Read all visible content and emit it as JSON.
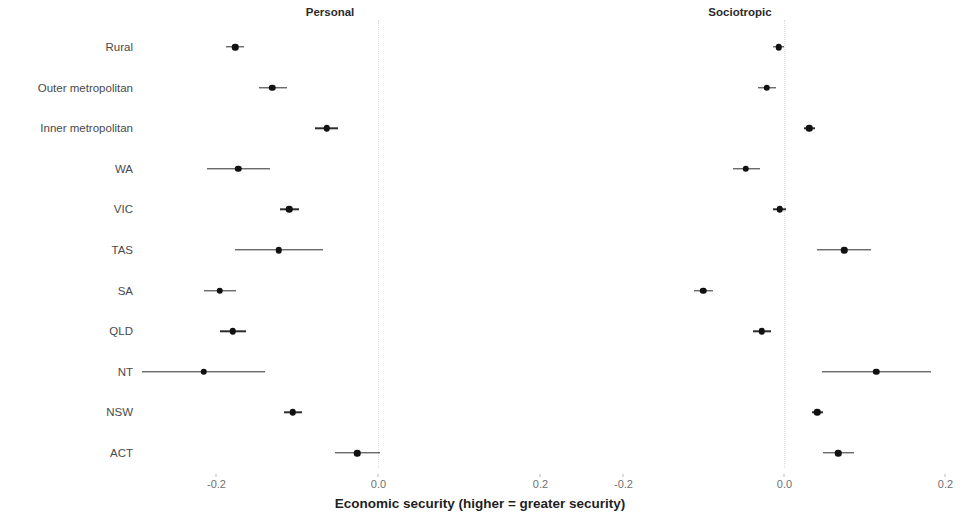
{
  "chart_data": {
    "type": "scatter",
    "title": "",
    "xlabel": "Economic security (higher = greater security)",
    "ylabel": "",
    "grid": false,
    "legend_position": "none",
    "orientation": "horizontal",
    "style": "coefficient-plot-with-confidence-intervals",
    "panels": [
      {
        "label": "Personal",
        "xlim": [
          -0.245,
          0.255
        ],
        "xticks": [
          -0.2,
          0.0,
          0.2
        ],
        "xtick_labels": [
          "-0.2",
          "0.0",
          "0.2"
        ],
        "reference_line": 0.0
      },
      {
        "label": "Sociotropic",
        "xlim": [
          -0.245,
          0.255
        ],
        "xticks": [
          -0.2,
          0.0,
          0.2
        ],
        "xtick_labels": [
          "-0.2",
          "0.0",
          "0.2"
        ],
        "reference_line": 0.0
      }
    ],
    "categories": [
      "Rural",
      "Outer metropolitan",
      "Inner metropolitan",
      "WA",
      "VIC",
      "TAS",
      "SA",
      "QLD",
      "NT",
      "NSW",
      "ACT"
    ],
    "series": [
      {
        "name": "Personal",
        "panel": 0,
        "estimates": [
          -0.177,
          -0.131,
          -0.064,
          -0.173,
          -0.11,
          -0.123,
          -0.196,
          -0.18,
          -0.216,
          -0.106,
          -0.026
        ],
        "ci_low": [
          -0.188,
          -0.148,
          -0.079,
          -0.212,
          -0.122,
          -0.177,
          -0.216,
          -0.196,
          -0.292,
          -0.117,
          -0.054
        ],
        "ci_high": [
          -0.166,
          -0.113,
          -0.05,
          -0.134,
          -0.098,
          -0.069,
          -0.176,
          -0.164,
          -0.14,
          -0.095,
          0.002
        ]
      },
      {
        "name": "Sociotropic",
        "panel": 1,
        "estimates": [
          -0.007,
          -0.022,
          0.031,
          -0.048,
          -0.006,
          0.074,
          -0.101,
          -0.028,
          0.114,
          0.041,
          0.067
        ],
        "ci_low": [
          -0.014,
          -0.033,
          0.024,
          -0.064,
          -0.014,
          0.041,
          -0.112,
          -0.039,
          0.047,
          0.034,
          0.048
        ],
        "ci_high": [
          0.0,
          -0.01,
          0.038,
          -0.031,
          0.002,
          0.107,
          -0.089,
          -0.017,
          0.182,
          0.048,
          0.086
        ]
      }
    ]
  },
  "axis": {
    "x_title": "Economic security (higher = greater security)"
  }
}
